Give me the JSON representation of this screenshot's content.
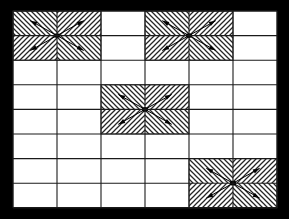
{
  "figure": {
    "type": "diagram",
    "canvas": {
      "width": 289,
      "height": 219,
      "background_color": "#ffffff"
    },
    "grid": {
      "name": "rectangular-grid",
      "columns": 6,
      "rows": 8,
      "origin_x": 13,
      "origin_y": 11,
      "cell_width": 44,
      "cell_height": 24.6,
      "line_color": "#1a1a1a",
      "line_width": 1.1,
      "outer_line_width": 1.4,
      "fill_color": "#ffffff"
    },
    "hatch": {
      "name": "diagonal-hatch",
      "color": "#262626",
      "line_width": 1.25,
      "spacing": 5.0,
      "background": "#ffffff"
    },
    "arrow": {
      "name": "radial-arrow",
      "color": "#000000",
      "shaft_width": 1.0,
      "head_length": 6.5,
      "head_width": 4.6,
      "count_per_patch": 4,
      "directions": [
        "up-left",
        "up-right",
        "down-left",
        "down-right"
      ],
      "points": "outward"
    },
    "center_node": {
      "name": "center-node",
      "color": "#000000",
      "radius_x": 3.2,
      "radius_y": 2.4,
      "shape": "diamond"
    },
    "patches": [
      {
        "id": "patch-top-left",
        "label": "Top-left hatched source",
        "col_start": 0,
        "row_start": 0,
        "col_span": 2,
        "row_span": 2
      },
      {
        "id": "patch-top-right",
        "label": "Top-right hatched source",
        "col_start": 3,
        "row_start": 0,
        "col_span": 2,
        "row_span": 2
      },
      {
        "id": "patch-middle",
        "label": "Middle hatched source",
        "col_start": 2,
        "row_start": 3,
        "col_span": 2,
        "row_span": 2
      },
      {
        "id": "patch-bottom-right",
        "label": "Bottom-right hatched source",
        "col_start": 4,
        "row_start": 6,
        "col_span": 2,
        "row_span": 2
      }
    ]
  }
}
